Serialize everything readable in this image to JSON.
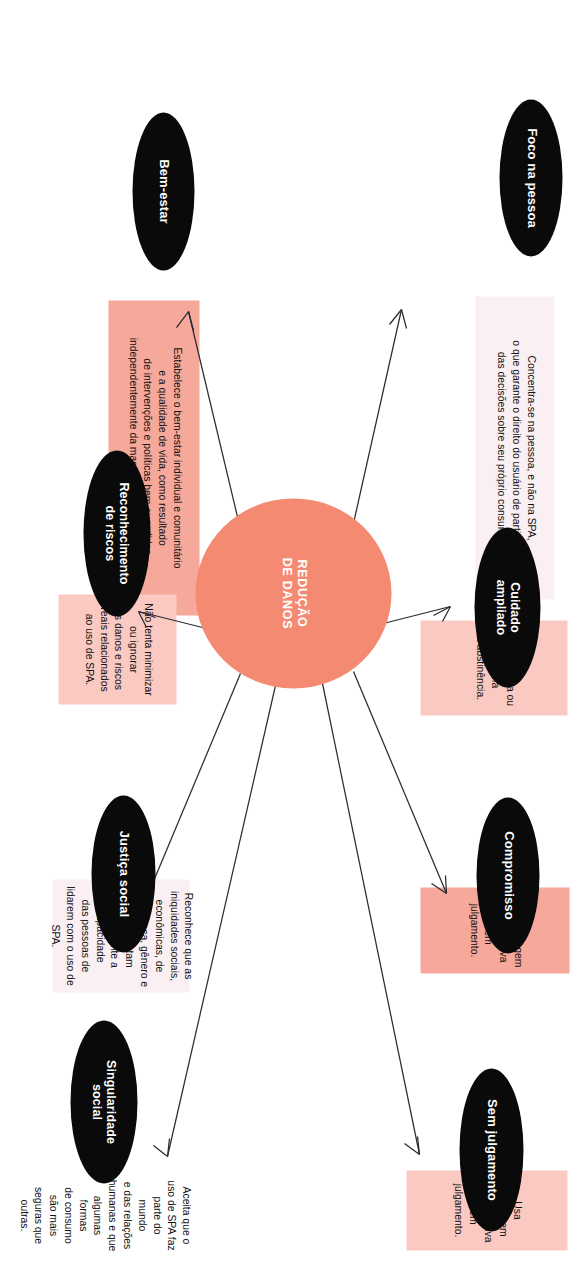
{
  "diagram": {
    "type": "radial-concept-map",
    "center": {
      "label": "REDUÇÃO\nDE DANOS",
      "color": "#f58a72",
      "text_color": "#ffffff"
    },
    "colors": {
      "node_fill": "#0a0a0a",
      "node_text": "#ffffff",
      "center_fill": "#f58a72",
      "band_strong_pink": "#f6a89a",
      "band_soft_pink": "#f9c9c2",
      "band_pale_pink": "#faf0f3",
      "band_white": "#ffffff",
      "arrow": "#2b2b33",
      "body_text": "#111111",
      "background": "#ffffff"
    },
    "nodes": [
      {
        "id": "foco-na-pessoa",
        "label": "Foco na pessoa",
        "description": "Concentra-se na pessoa, e não na SPA,\no que garante o direito do usuário de participar\ndas decisões sobre seu próprio consumo.",
        "band_color": "#faf0f3"
      },
      {
        "id": "bem-estar",
        "label": "Bem-estar",
        "description": "Estabelece o bem-estar individual e comunitário\ne a qualidade de vida, como resultado\nde intervenções e políticas bem-sucedidas,\nindependentemente da manutenção do uso de SPA.",
        "band_color": "#f6a89a"
      },
      {
        "id": "cuidado-ampliado",
        "label": "Cuidado\nampliado",
        "description": "Não é oposta ou contrária\nà abstinência.",
        "band_color": "#f9c9c2"
      },
      {
        "id": "reconhecimento-de-riscos",
        "label": "Reconhecimento\nde riscos",
        "description": "Não tenta minimizar ou ignorar\nos danos e riscos reais relacionados\nao uso de SPA.",
        "band_color": "#f9c9c2"
      },
      {
        "id": "compromisso",
        "label": "Compromisso",
        "description": "Usa abordagem não coercitiva\ne sem julgamento.",
        "band_color": "#f6a89a"
      },
      {
        "id": "justica-social",
        "label": "Justiça social",
        "description": "Reconhece que as iniquidades sociais,\neconômicas, de classe, raça, gênero e\noutras afetam diretamente a capacidade\ndas pessoas de lidarem com o uso de SPA.",
        "band_color": "#faf0f3"
      },
      {
        "id": "sem-julgamento",
        "label": "Sem julgamento",
        "description": "Usa abordagem não coercitiva\ne sem julgamento.",
        "band_color": "#f9c9c2"
      },
      {
        "id": "singularidade-social",
        "label": "Singularidade\nsocial",
        "description": "Aceita que o uso de SPA faz parte do mundo\ne das relações humanas e que algumas formas\nde consumo são mais seguras que outras.",
        "band_color": "#ffffff"
      }
    ]
  }
}
